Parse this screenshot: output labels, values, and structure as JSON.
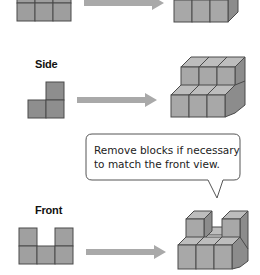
{
  "rows": [
    {
      "id": "top",
      "label": "",
      "view_shape": "3-squares-row-cut-top",
      "result_shape": "3x1-block-row"
    },
    {
      "id": "side",
      "label": "Side",
      "view_shape": "L-shape-3-squares",
      "result_shape": "two-tier-step-block"
    },
    {
      "id": "front",
      "label": "Front",
      "view_shape": "U-shape-5-squares",
      "result_shape": "two-tier-U-block"
    }
  ],
  "callout": {
    "line1": "Remove blocks if necessary",
    "line2": "to match the front view."
  },
  "icons": {
    "arrow": "right-arrow-icon"
  },
  "colors": {
    "view_fill": "#9a9a9a",
    "block_face": "#a8a8a8",
    "block_top": "#bdbdbd",
    "block_side": "#8c8c8c",
    "arrow": "#a9a9a9",
    "stroke": "#4a4a4a"
  }
}
